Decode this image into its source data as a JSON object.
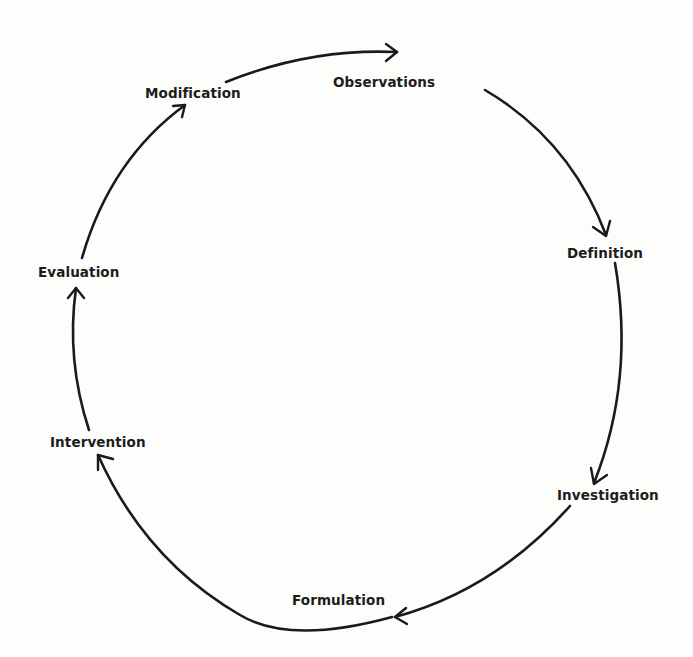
{
  "diagram": {
    "type": "cycle",
    "direction": "clockwise",
    "colors": {
      "background": "#fdfdfb",
      "stroke": "#1a1a1a",
      "text": "#1c1c1c"
    },
    "stages": [
      {
        "id": "observations",
        "label": "Observations"
      },
      {
        "id": "definition",
        "label": "Definition"
      },
      {
        "id": "investigation",
        "label": "Investigation"
      },
      {
        "id": "formulation",
        "label": "Formulation"
      },
      {
        "id": "intervention",
        "label": "Intervention"
      },
      {
        "id": "evaluation",
        "label": "Evaluation"
      },
      {
        "id": "modification",
        "label": "Modification"
      }
    ],
    "edges": [
      {
        "from": "modification",
        "to": "observations"
      },
      {
        "from": "observations",
        "to": "definition"
      },
      {
        "from": "definition",
        "to": "investigation"
      },
      {
        "from": "investigation",
        "to": "formulation"
      },
      {
        "from": "formulation",
        "to": "intervention"
      },
      {
        "from": "intervention",
        "to": "evaluation"
      },
      {
        "from": "evaluation",
        "to": "modification"
      }
    ]
  }
}
